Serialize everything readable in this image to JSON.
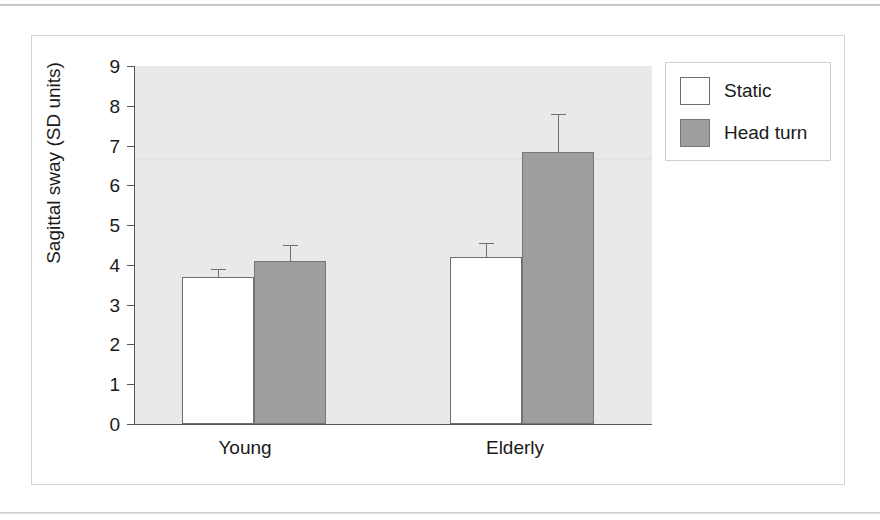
{
  "chart_data": {
    "type": "bar",
    "title": "",
    "xlabel": "",
    "ylabel": "Sagittal sway (SD units)",
    "categories": [
      "Young",
      "Elderly"
    ],
    "series": [
      {
        "name": "Static",
        "color": "#ffffff",
        "values": [
          3.7,
          4.2
        ],
        "errors": [
          0.2,
          0.35
        ]
      },
      {
        "name": "Head turn",
        "color": "#9e9e9e",
        "values": [
          4.1,
          6.85
        ],
        "errors": [
          0.4,
          0.95
        ]
      }
    ],
    "ylim": [
      0,
      9
    ],
    "ytick_labels": [
      "0",
      "1",
      "2",
      "3",
      "4",
      "5",
      "6",
      "7",
      "8",
      "9"
    ],
    "ytick_values": [
      0,
      1,
      2,
      3,
      4,
      5,
      6,
      7,
      8,
      9
    ],
    "grid": false,
    "legend_position": "top-right-outside",
    "plot_background": "#e9e9e9",
    "axis_color": "#555555",
    "error_bar_style": "upper-cap-only"
  },
  "legend": {
    "entries": [
      {
        "label": "Static",
        "swatch": "#ffffff"
      },
      {
        "label": "Head turn",
        "swatch": "#9e9e9e"
      }
    ]
  },
  "axis": {
    "y_title": "Sagittal sway (SD units)",
    "ticks": [
      "9",
      "8",
      "7",
      "6",
      "5",
      "4",
      "3",
      "2",
      "1",
      "0"
    ]
  },
  "categories": {
    "young": "Young",
    "elderly": "Elderly"
  }
}
